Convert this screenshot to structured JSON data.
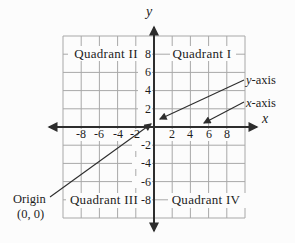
{
  "figure": {
    "quadrants": {
      "q1": "Quadrant I",
      "q2": "Quadrant II",
      "q3": "Quadrant III",
      "q4": "Quadrant IV"
    },
    "axis_labels": {
      "x": "x",
      "y": "y"
    },
    "x_tick_labels": [
      "-8",
      "-6",
      "-4",
      "-2",
      "2",
      "4",
      "6",
      "8"
    ],
    "y_tick_labels": [
      "8",
      "6",
      "4",
      "2",
      "-2",
      "-4",
      "-6",
      "-8"
    ],
    "callouts": {
      "y_axis": {
        "var": "y",
        "suffix": "-axis"
      },
      "x_axis": {
        "var": "x",
        "suffix": "-axis"
      },
      "origin": {
        "label": "Origin",
        "point": "(0, 0)"
      }
    },
    "colors": {
      "background": "#fcfcfc",
      "grid": "#a8a8a8",
      "axis": "#2d2d2d",
      "text": "#1d1d1d"
    }
  },
  "chart_data": {
    "type": "coordinate-plane",
    "x_range": [
      -10,
      10
    ],
    "y_range": [
      -10,
      10
    ],
    "grid_step": 2,
    "grid": true,
    "x_ticks": [
      -8,
      -6,
      -4,
      -2,
      2,
      4,
      6,
      8
    ],
    "y_ticks": [
      8,
      6,
      4,
      2,
      -2,
      -4,
      -6,
      -8
    ],
    "xlabel": "x",
    "ylabel": "y",
    "quadrant_labels": [
      "Quadrant I",
      "Quadrant II",
      "Quadrant III",
      "Quadrant IV"
    ],
    "annotations": [
      {
        "text": "y-axis",
        "points_to": "y-axis near origin"
      },
      {
        "text": "x-axis",
        "points_to": "x-axis near x=5"
      },
      {
        "text": "Origin (0, 0)",
        "points_to": "origin"
      }
    ]
  }
}
